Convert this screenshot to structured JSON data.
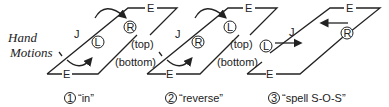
{
  "title": [
    "Hand",
    "Motions"
  ],
  "edge_labels": {
    "e": "E",
    "j": "J",
    "top": "(top)",
    "bottom": "(bottom)"
  },
  "hands": {
    "left": "L",
    "right": "R"
  },
  "panels": [
    {
      "number": "1",
      "caption": "“in”"
    },
    {
      "number": "2",
      "caption": "“reverse”"
    },
    {
      "number": "3",
      "caption": "“spell S-O-S”"
    }
  ]
}
